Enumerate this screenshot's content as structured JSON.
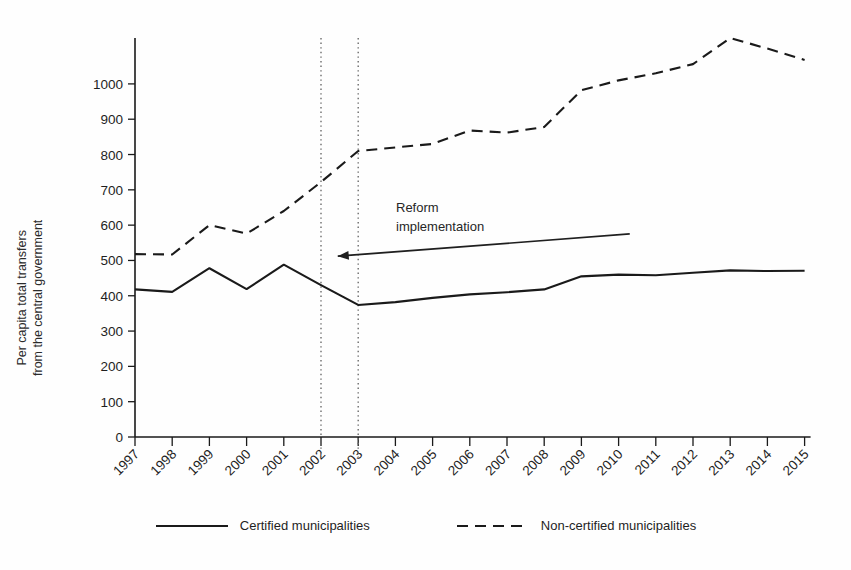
{
  "chart_data": {
    "type": "line",
    "title": "",
    "subtitle": "",
    "xlabel": "",
    "ylabel": "Per capita total transfers\nfrom the central government",
    "ylabel_line1": "Per capita total transfers",
    "ylabel_line2": "from the central government",
    "x": [
      1997,
      1998,
      1999,
      2000,
      2001,
      2002,
      2003,
      2004,
      2005,
      2006,
      2007,
      2008,
      2009,
      2010,
      2011,
      2012,
      2013,
      2014,
      2015
    ],
    "categories": [
      "1997",
      "1998",
      "1999",
      "2000",
      "2001",
      "2002",
      "2003",
      "2004",
      "2005",
      "2006",
      "2007",
      "2008",
      "2009",
      "2010",
      "2011",
      "2012",
      "2013",
      "2014",
      "2015"
    ],
    "xlim": [
      1997,
      2015
    ],
    "ylim": [
      0,
      1130
    ],
    "yticks": [
      0,
      100,
      200,
      300,
      400,
      500,
      600,
      700,
      800,
      900,
      1000
    ],
    "ytick_labels": [
      "0",
      "100",
      "200",
      "300",
      "400",
      "500",
      "600",
      "700",
      "800",
      "900",
      "1000"
    ],
    "grid": false,
    "legend_position": "bottom",
    "series": [
      {
        "name": "Certified municipalities",
        "style": "solid",
        "color": "#1a1a1a",
        "values": [
          418,
          411,
          478,
          419,
          488,
          430,
          374,
          382,
          394,
          404,
          410,
          418,
          455,
          460,
          458,
          465,
          472,
          470,
          471
        ]
      },
      {
        "name": "Non-certified municipalities",
        "style": "dashed",
        "color": "#1a1a1a",
        "values": [
          518,
          517,
          600,
          576,
          640,
          722,
          810,
          820,
          830,
          868,
          862,
          878,
          982,
          1010,
          1030,
          1056,
          1130,
          1100,
          1068
        ]
      }
    ],
    "annotations": [
      {
        "name": "reform-implementation",
        "text_line1": "Reform",
        "text_line2": "implementation",
        "arrow_from_x": 2010.3,
        "arrow_to_x": 2002.45,
        "arrow_from_y": 575,
        "arrow_to_y": 512
      }
    ],
    "vertical_reference_lines": [
      {
        "name": "reform-line-2002",
        "x": 2002,
        "style": "dotted"
      },
      {
        "name": "reform-line-2003",
        "x": 2003,
        "style": "dotted"
      }
    ]
  },
  "legend": {
    "items": [
      {
        "label": "Certified municipalities",
        "style": "solid"
      },
      {
        "label": "Non-certified municipalities",
        "style": "dashed"
      }
    ]
  },
  "annotation": {
    "line1": "Reform",
    "line2": "implementation"
  }
}
